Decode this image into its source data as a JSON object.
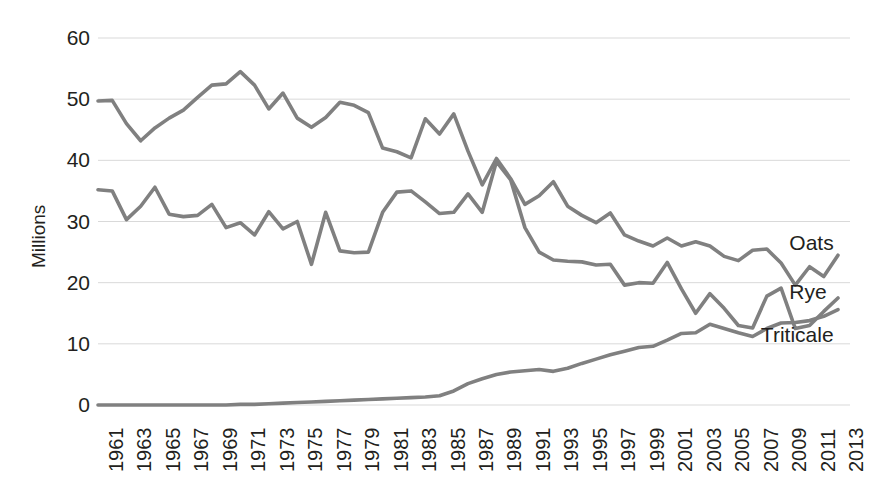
{
  "chart_data": {
    "type": "line",
    "title": "",
    "xlabel": "",
    "ylabel": "Millions",
    "ylim": [
      0,
      60
    ],
    "ytick_labels": [
      "60",
      "50",
      "40",
      "30",
      "20",
      "10",
      "0"
    ],
    "ytick_values": [
      60,
      50,
      40,
      30,
      20,
      10,
      0
    ],
    "grid": true,
    "legend_position": "inline-right",
    "x": [
      1961,
      1962,
      1963,
      1964,
      1965,
      1966,
      1967,
      1968,
      1969,
      1970,
      1971,
      1972,
      1973,
      1974,
      1975,
      1976,
      1977,
      1978,
      1979,
      1980,
      1981,
      1982,
      1983,
      1984,
      1985,
      1986,
      1987,
      1988,
      1989,
      1990,
      1991,
      1992,
      1993,
      1994,
      1995,
      1996,
      1997,
      1998,
      1999,
      2000,
      2001,
      2002,
      2003,
      2004,
      2005,
      2006,
      2007,
      2008,
      2009,
      2010,
      2011,
      2012,
      2013
    ],
    "xtick_labels": [
      "1961",
      "1963",
      "1965",
      "1967",
      "1969",
      "1971",
      "1973",
      "1975",
      "1977",
      "1979",
      "1981",
      "1983",
      "1985",
      "1987",
      "1989",
      "1991",
      "1993",
      "1995",
      "1997",
      "1999",
      "2001",
      "2003",
      "2005",
      "2007",
      "2009",
      "2011",
      "2013"
    ],
    "series": [
      {
        "name": "Oats",
        "color": "#808080",
        "values": [
          49.7,
          49.8,
          46.0,
          43.2,
          45.3,
          46.9,
          48.2,
          50.3,
          52.3,
          52.5,
          54.5,
          52.3,
          48.4,
          51.0,
          46.9,
          45.4,
          47.0,
          49.5,
          49.0,
          47.8,
          42.0,
          41.4,
          40.4,
          46.8,
          44.3,
          47.6,
          41.5,
          36.0,
          40.3,
          37.0,
          32.8,
          34.2,
          36.5,
          32.5,
          31.0,
          29.8,
          31.4,
          27.8,
          26.8,
          26.0,
          27.3,
          26.0,
          26.7,
          26.0,
          24.3,
          23.6,
          25.3,
          25.5,
          23.2,
          19.6,
          22.6,
          21.0,
          24.5
        ]
      },
      {
        "name": "Rye",
        "color": "#808080",
        "values": [
          35.2,
          35.0,
          30.3,
          32.5,
          35.6,
          31.2,
          30.8,
          31.0,
          32.8,
          29.0,
          29.8,
          27.8,
          31.6,
          28.8,
          30.0,
          23.0,
          31.5,
          25.2,
          24.9,
          25.0,
          31.5,
          34.8,
          35.0,
          33.2,
          31.3,
          31.5,
          34.5,
          31.5,
          39.8,
          36.8,
          29.0,
          25.0,
          23.7,
          23.5,
          23.4,
          22.9,
          23.0,
          19.6,
          20.0,
          19.9,
          23.3,
          19.0,
          15.0,
          18.2,
          15.8,
          13.0,
          12.6,
          17.8,
          19.1,
          12.5,
          13.0,
          15.3,
          17.5
        ]
      },
      {
        "name": "Triticale",
        "color": "#808080",
        "values": [
          0.0,
          0.0,
          0.0,
          0.0,
          0.0,
          0.0,
          0.0,
          0.0,
          0.0,
          0.0,
          0.1,
          0.1,
          0.2,
          0.3,
          0.4,
          0.5,
          0.6,
          0.7,
          0.8,
          0.9,
          1.0,
          1.1,
          1.2,
          1.3,
          1.5,
          2.3,
          3.5,
          4.3,
          5.0,
          5.4,
          5.6,
          5.8,
          5.5,
          6.0,
          6.8,
          7.5,
          8.2,
          8.8,
          9.4,
          9.6,
          10.6,
          11.7,
          11.8,
          13.2,
          12.5,
          11.8,
          11.2,
          12.5,
          13.4,
          13.5,
          13.8,
          14.5,
          15.6
        ]
      }
    ],
    "annotations": [
      {
        "text": "Oats",
        "x": 2010,
        "y": 26.5
      },
      {
        "text": "Rye",
        "x": 2010,
        "y": 18.5
      },
      {
        "text": "Triticale",
        "x": 2008,
        "y": 11.5
      }
    ]
  },
  "style": {
    "line_color": "#808080",
    "grid_color": "#d9d9d9",
    "text_color": "#231f20",
    "background": "#ffffff"
  }
}
